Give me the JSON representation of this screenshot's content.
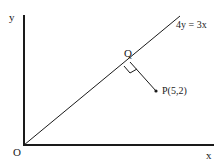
{
  "diagram": {
    "axes": {
      "x_label": "x",
      "y_label": "y",
      "origin_label": "O"
    },
    "line": {
      "equation": "4y = 3x"
    },
    "foot_point": {
      "label": "Q"
    },
    "point": {
      "label": "P(5,2)"
    },
    "colors": {
      "ink": "#1a1a1a",
      "background": "#ffffff"
    }
  }
}
